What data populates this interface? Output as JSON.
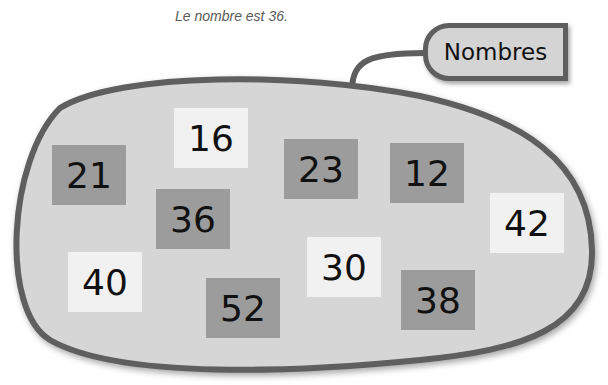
{
  "caption": "Le nombre est 36.",
  "tag": {
    "label": "Nombres"
  },
  "colors": {
    "blob_fill": "#d6d6d6",
    "blob_stroke": "#5f5f5f",
    "dark_box": "#9c9c9c",
    "light_box": "#f1f1f1"
  },
  "numbers": [
    {
      "value": "16",
      "style": "light"
    },
    {
      "value": "21",
      "style": "dark"
    },
    {
      "value": "23",
      "style": "dark"
    },
    {
      "value": "12",
      "style": "dark"
    },
    {
      "value": "36",
      "style": "dark"
    },
    {
      "value": "42",
      "style": "light"
    },
    {
      "value": "40",
      "style": "light"
    },
    {
      "value": "30",
      "style": "light"
    },
    {
      "value": "52",
      "style": "dark"
    },
    {
      "value": "38",
      "style": "dark"
    }
  ]
}
